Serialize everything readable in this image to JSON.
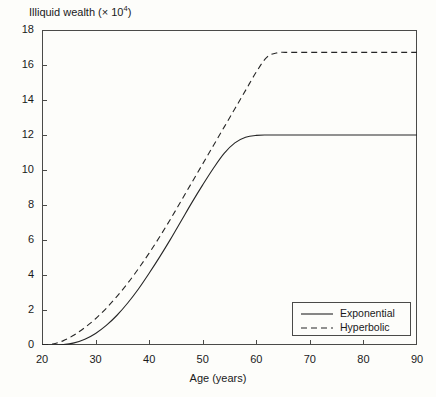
{
  "chart_data": {
    "type": "line",
    "title_base": "Illiquid wealth (× 10",
    "title_sup": "4",
    "title_tail": ")",
    "xlabel": "Age (years)",
    "ylabel": "Illiquid wealth (× 10⁴)",
    "xlim": [
      20,
      90
    ],
    "ylim": [
      0,
      18
    ],
    "xticks": [
      20,
      30,
      40,
      50,
      60,
      70,
      80,
      90
    ],
    "yticks": [
      0,
      2,
      4,
      6,
      8,
      10,
      12,
      14,
      16,
      18
    ],
    "grid": false,
    "legend_position": "bottom-right",
    "x": [
      20,
      22,
      24,
      26,
      28,
      30,
      32,
      34,
      36,
      38,
      40,
      42,
      44,
      46,
      48,
      50,
      52,
      54,
      56,
      58,
      60,
      62,
      64,
      66,
      68,
      70,
      72,
      74,
      76,
      78,
      80,
      82,
      84,
      86,
      88,
      90
    ],
    "series": [
      {
        "name": "Exponential",
        "style": "solid",
        "color": "#262626",
        "values": [
          0.0,
          0.0,
          0.02,
          0.12,
          0.33,
          0.66,
          1.12,
          1.7,
          2.4,
          3.2,
          4.1,
          5.05,
          6.05,
          7.1,
          8.15,
          9.15,
          10.1,
          10.95,
          11.55,
          11.87,
          11.98,
          12.0,
          12.0,
          12.0,
          12.0,
          12.0,
          12.0,
          12.0,
          12.0,
          12.0,
          12.0,
          12.0,
          12.0,
          12.0,
          12.0,
          12.0
        ]
      },
      {
        "name": "Hyperbolic",
        "style": "dashed",
        "color": "#262626",
        "values": [
          0.0,
          0.06,
          0.25,
          0.57,
          1.0,
          1.5,
          2.1,
          2.78,
          3.53,
          4.36,
          5.25,
          6.2,
          7.2,
          8.25,
          9.3,
          10.35,
          11.4,
          12.45,
          13.5,
          14.55,
          15.6,
          16.45,
          16.7,
          16.72,
          16.72,
          16.72,
          16.72,
          16.72,
          16.72,
          16.72,
          16.72,
          16.72,
          16.72,
          16.72,
          16.72,
          16.72
        ]
      }
    ],
    "legend": [
      {
        "label": "Exponential",
        "style": "solid"
      },
      {
        "label": "Hyperbolic",
        "style": "dashed"
      }
    ],
    "annotations": []
  }
}
